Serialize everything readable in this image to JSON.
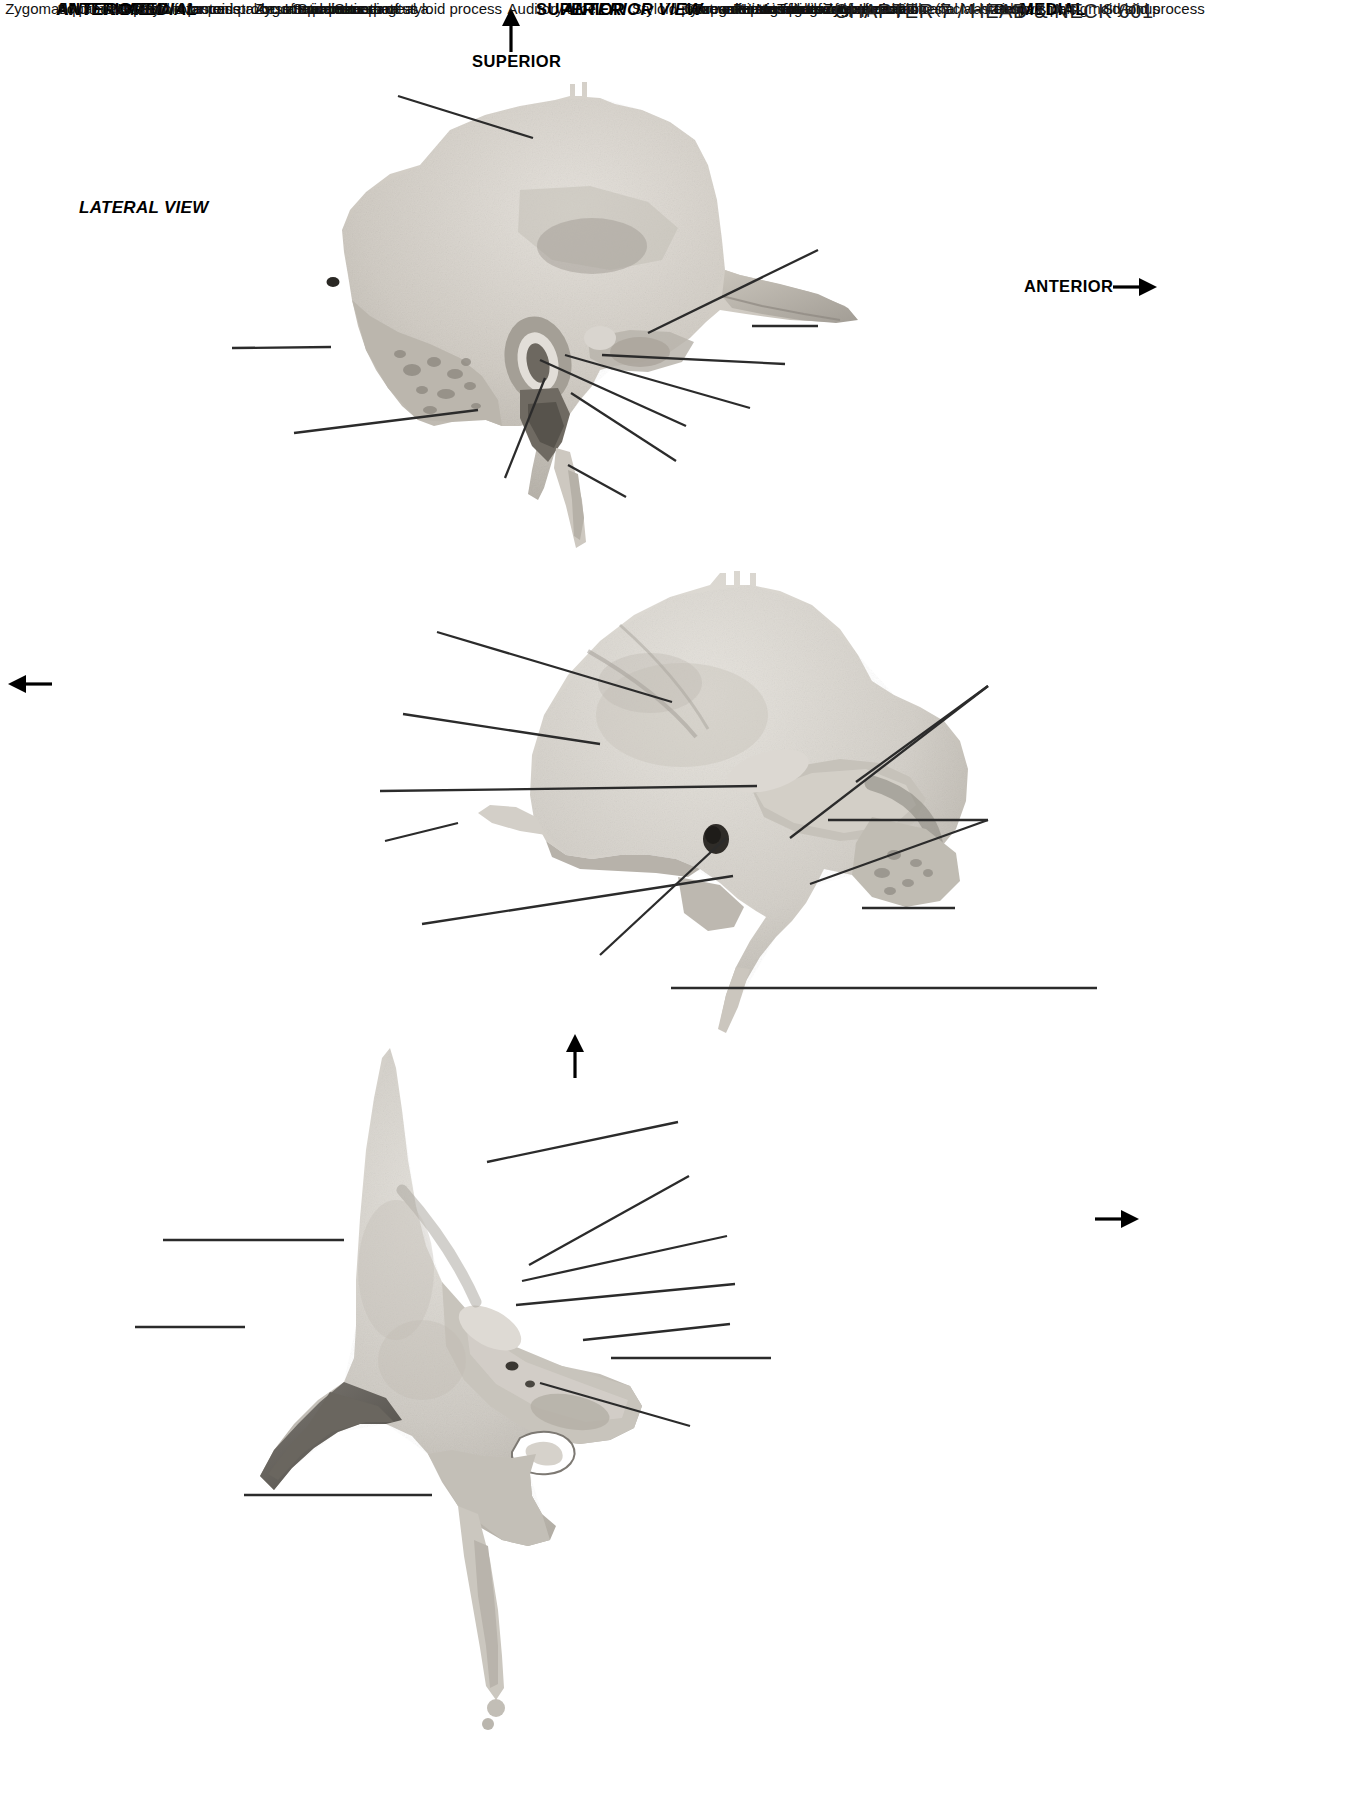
{
  "figure": {
    "footer": "CHAPTER 7 / HEAD & NECK    601"
  },
  "panels": [
    {
      "id": "lateral",
      "view_name": "LATERAL VIEW",
      "orientation_arrows": [
        {
          "label": "SUPERIOR",
          "direction": "up"
        },
        {
          "label": "ANTERIOR",
          "direction": "right"
        }
      ],
      "labels": [
        {
          "text": "Squamous part",
          "side": "left"
        },
        {
          "text": "Mastoid foramen",
          "side": "left"
        },
        {
          "text": "Mastoid process",
          "side": "left"
        },
        {
          "text": "Sheath of styloid process",
          "side": "left"
        },
        {
          "text": "Zygomatic process",
          "side": "right"
        },
        {
          "text": "Zygomatic arch",
          "side": "right"
        },
        {
          "text": "Articular tubercle",
          "side": "right"
        },
        {
          "text": "Mandibular fossa",
          "side": "right"
        },
        {
          "text": "Ext. acoustic meatus",
          "side": "right"
        },
        {
          "text": "Tympanic part",
          "side": "right"
        },
        {
          "text": "Styloid process",
          "side": "right"
        }
      ]
    },
    {
      "id": "anteromedial",
      "view_name_line1": "ANTEROMEDIAL",
      "view_name_line2": "VIEW",
      "orientation_arrows": [
        {
          "label": "ANTERIOR",
          "direction": "left"
        }
      ],
      "labels": [
        {
          "text": "Groove for parietal br. of middle meningeal a.",
          "side": "left"
        },
        {
          "text": "Squamous part",
          "side": "left"
        },
        {
          "text": "Arcuate eminence",
          "side": "left"
        },
        {
          "text": "Zygomatic process",
          "side": "left"
        },
        {
          "text": "Int. acoustic meatus",
          "side": "left"
        },
        {
          "text": "Auditory tube",
          "side": "left"
        },
        {
          "text": "Petrous part",
          "side": "right"
        },
        {
          "text": "Groove for sigmoid sinus",
          "side": "right"
        },
        {
          "text": "Mastoid part",
          "side": "right"
        },
        {
          "text": "Styloid process",
          "side": "right"
        }
      ]
    },
    {
      "id": "anterior",
      "view_name": "ANTERIOR VIEW",
      "orientation_arrows": [
        {
          "label": "SUPERIOR",
          "direction": "up"
        },
        {
          "label": "MEDIAL",
          "direction": "right"
        }
      ],
      "labels": [
        {
          "text": "Squamous part",
          "side": "left"
        },
        {
          "text": "Zygomatic process",
          "side": "left"
        },
        {
          "text": "Styloid process",
          "side": "left"
        },
        {
          "text": "Groove for sigmoid sinus",
          "side": "right"
        },
        {
          "text": "Arcuate eminence",
          "side": "right"
        },
        {
          "text": "Petrous part",
          "side": "right"
        },
        {
          "text": "Hiatus for greater petrosal n. (facial hiatus)",
          "side": "right"
        },
        {
          "text": "Hiatus for lesser petrosal n.",
          "side": "right"
        },
        {
          "text": "Trigeminal impression",
          "side": "right"
        },
        {
          "text": "Irregular erosion of roof of carotid canal",
          "side": "right"
        }
      ]
    }
  ],
  "colors": {
    "text": "#111111",
    "leader": "#2b2b2b",
    "bone_light": "#d8d4cd",
    "bone_mid": "#bcb7ae",
    "bone_dark": "#8e8a83",
    "background": "#ffffff"
  }
}
